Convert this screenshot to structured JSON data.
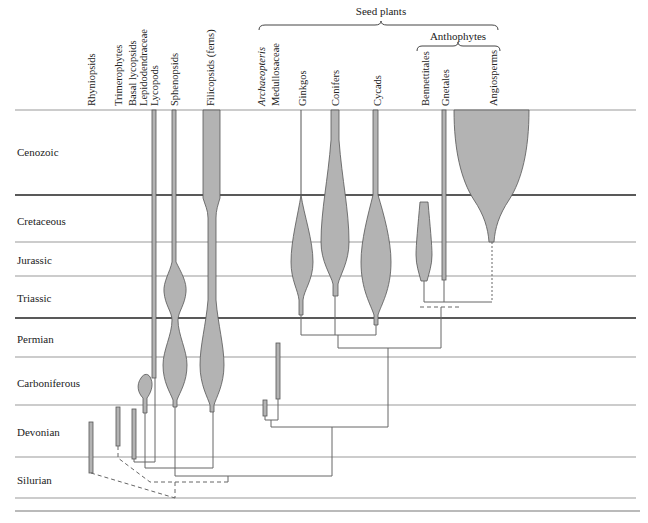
{
  "diagram": {
    "groups": [
      {
        "label": "Seed plants",
        "x": 381,
        "y": 5
      },
      {
        "label": "Anthophytes",
        "x": 458,
        "y": 30
      }
    ],
    "taxa": [
      {
        "label": "Rhyniopsids",
        "x": 86,
        "italic": false
      },
      {
        "label": "Trimerophytes",
        "x": 113,
        "italic": false
      },
      {
        "label": "Basal lycopsids",
        "x": 127,
        "italic": false
      },
      {
        "label": "Lepidodendraceae",
        "x": 138,
        "italic": false
      },
      {
        "label": "Lycopods",
        "x": 149,
        "italic": false
      },
      {
        "label": "Sphenopsids",
        "x": 169,
        "italic": false
      },
      {
        "label": "Filicopsids (ferns)",
        "x": 205,
        "italic": false
      },
      {
        "label": "Archaeopteris",
        "x": 256,
        "italic": true
      },
      {
        "label": "Medullosaceae",
        "x": 270,
        "italic": false
      },
      {
        "label": "Ginkgos",
        "x": 297,
        "italic": false
      },
      {
        "label": "Conifers",
        "x": 330,
        "italic": false
      },
      {
        "label": "Cycads",
        "x": 372,
        "italic": false
      },
      {
        "label": "Bennettitales",
        "x": 420,
        "italic": false
      },
      {
        "label": "Gnetales",
        "x": 440,
        "italic": false
      },
      {
        "label": "Angiosperms",
        "x": 488,
        "italic": false
      }
    ],
    "periods": [
      {
        "label": "Cenozoic",
        "y": 146
      },
      {
        "label": "Cretaceous",
        "y": 215
      },
      {
        "label": "Jurassic",
        "y": 254
      },
      {
        "label": "Triassic",
        "y": 292
      },
      {
        "label": "Permian",
        "y": 333
      },
      {
        "label": "Carboniferous",
        "y": 377
      },
      {
        "label": "Devonian",
        "y": 426
      },
      {
        "label": "Silurian",
        "y": 474
      }
    ],
    "colors": {
      "fill": "#b3b3b3",
      "stroke": "#555555",
      "line": "#888888",
      "era_line": "#222222"
    }
  }
}
